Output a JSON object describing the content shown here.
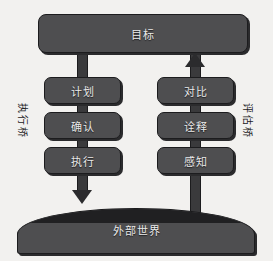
{
  "diagram": {
    "colors": {
      "background": "#f2f1ef",
      "node_fill": "#4e4e50",
      "node_stroke": "#1c1c1e",
      "node_shadow": "#2b2b2d",
      "node_text": "#e9e9e9",
      "connector": "#3a3a3c",
      "side_label_text": "#222224"
    },
    "goal": {
      "label": "目标",
      "name": "goal-node"
    },
    "execution_bridge": {
      "side_label": "执行桥",
      "direction": "down",
      "steps": [
        {
          "label": "计划"
        },
        {
          "label": "确认"
        },
        {
          "label": "执行"
        }
      ]
    },
    "evaluation_bridge": {
      "side_label": "评估桥",
      "direction": "up",
      "steps": [
        {
          "label": "对比"
        },
        {
          "label": "诠释"
        },
        {
          "label": "感知"
        }
      ]
    },
    "world": {
      "label": "外部世界"
    },
    "arrows": [
      {
        "name": "execution-arrow-down",
        "points": "down",
        "from": "执行",
        "to": "外部世界"
      },
      {
        "name": "evaluation-arrow-up",
        "points": "up",
        "from": "对比",
        "to": "目标"
      }
    ]
  }
}
